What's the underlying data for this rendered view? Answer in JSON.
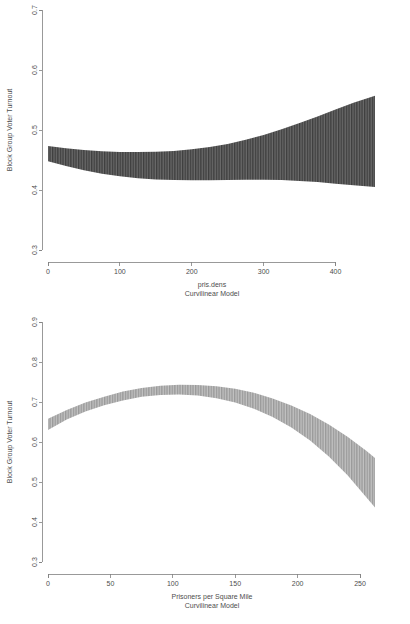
{
  "figure": {
    "background_color": "#ffffff",
    "axis_color": "#808080",
    "text_color": "#4d4d4d",
    "panel_count": 2
  },
  "chart_data": [
    {
      "type": "area",
      "title": "",
      "subtitle": "Curvilinear Model",
      "xlabel": "pris.dens",
      "ylabel": "Block Group Voter Turnout",
      "xlabel_line1": "pris.dens",
      "xlabel_line2": "Curvilinear Model",
      "band_color": "#4f4f4f",
      "hatch": "vertical-lines",
      "grid": false,
      "legend": "none",
      "xlim": [
        0,
        455
      ],
      "ylim": [
        0.3,
        0.7
      ],
      "xticks": [
        0,
        100,
        200,
        300,
        400
      ],
      "xtick_labels": [
        "0",
        "100",
        "200",
        "300",
        "400"
      ],
      "yticks": [
        0.3,
        0.4,
        0.5,
        0.6,
        0.7
      ],
      "ytick_labels": [
        "0.3",
        "0.4",
        "0.5",
        "0.6",
        "0.7"
      ],
      "x": [
        0,
        25,
        50,
        75,
        100,
        125,
        150,
        175,
        200,
        225,
        250,
        275,
        300,
        325,
        350,
        375,
        400,
        425,
        455
      ],
      "upper": [
        0.4735,
        0.4695,
        0.4665,
        0.4645,
        0.4635,
        0.4632,
        0.4637,
        0.4652,
        0.4678,
        0.4716,
        0.4768,
        0.4836,
        0.4918,
        0.5012,
        0.5115,
        0.5225,
        0.534,
        0.5455,
        0.557
      ],
      "lower": [
        0.448,
        0.44,
        0.433,
        0.4272,
        0.4228,
        0.4196,
        0.4176,
        0.4165,
        0.4162,
        0.4164,
        0.4168,
        0.4172,
        0.4172,
        0.4166,
        0.4152,
        0.4132,
        0.4106,
        0.4078,
        0.405
      ]
    },
    {
      "type": "area",
      "title": "",
      "subtitle": "Curvilinear Model",
      "xlabel": "Prisoners per Square Mile",
      "ylabel": "Block Group Voter Turnout",
      "xlabel_line1": "Prisoners per Square Mile",
      "xlabel_line2": "Curvilinear Model",
      "band_color": "#a8a8a8",
      "hatch": "vertical-lines",
      "grid": false,
      "legend": "none",
      "xlim": [
        0,
        262
      ],
      "ylim": [
        0.3,
        0.9
      ],
      "xticks": [
        0,
        50,
        100,
        150,
        200,
        250
      ],
      "xtick_labels": [
        "0",
        "50",
        "100",
        "150",
        "200",
        "250"
      ],
      "yticks": [
        0.3,
        0.4,
        0.5,
        0.6,
        0.7,
        0.8,
        0.9
      ],
      "ytick_labels": [
        "0.3",
        "0.4",
        "0.5",
        "0.6",
        "0.7",
        "0.8",
        "0.9"
      ],
      "x": [
        0,
        15,
        30,
        45,
        60,
        75,
        90,
        105,
        120,
        135,
        150,
        165,
        180,
        195,
        210,
        225,
        240,
        255,
        262
      ],
      "upper": [
        0.658,
        0.68,
        0.699,
        0.713,
        0.726,
        0.735,
        0.7405,
        0.743,
        0.7428,
        0.7395,
        0.733,
        0.723,
        0.709,
        0.6915,
        0.67,
        0.644,
        0.613,
        0.578,
        0.56
      ],
      "lower": [
        0.63,
        0.656,
        0.676,
        0.692,
        0.704,
        0.713,
        0.7175,
        0.7185,
        0.716,
        0.7095,
        0.6985,
        0.683,
        0.6625,
        0.636,
        0.6035,
        0.564,
        0.517,
        0.462,
        0.436
      ]
    }
  ]
}
